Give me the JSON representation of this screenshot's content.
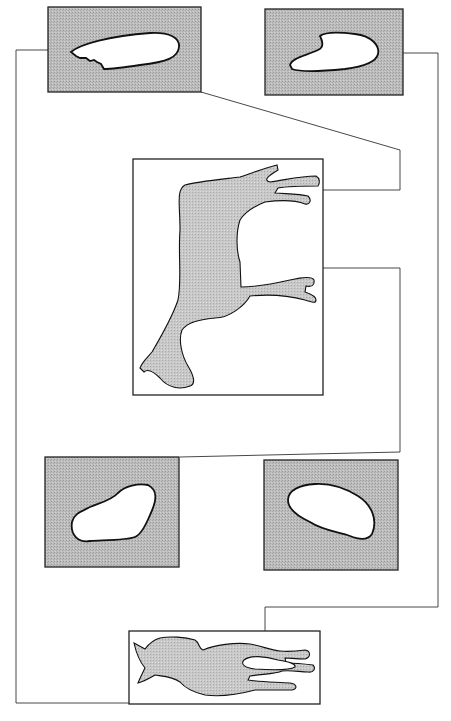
{
  "figure": {
    "type": "anatomical cross-section diagram",
    "colors": {
      "panel_fill": "#b9b9b9",
      "horse_fill": "#c4c4c4",
      "line": "#222222",
      "background": "#ffffff"
    },
    "panels": [
      {
        "id": "section-top-left",
        "position": "top-left",
        "shape": "elongated oval with serrated lower edge"
      },
      {
        "id": "section-top-right",
        "position": "top-right",
        "shape": "elongated oval with notch"
      },
      {
        "id": "section-bottom-left",
        "position": "middle-left",
        "shape": "irregular oval"
      },
      {
        "id": "section-bottom-right",
        "position": "middle-right",
        "shape": "rounded oval"
      }
    ],
    "views": [
      {
        "id": "lateral-view",
        "position": "center",
        "subject": "horse lying, side view"
      },
      {
        "id": "dorsal-view",
        "position": "bottom",
        "subject": "horse, top view"
      }
    ]
  }
}
